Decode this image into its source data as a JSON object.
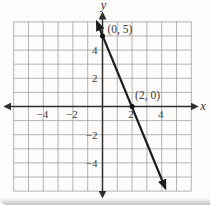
{
  "chart_data": {
    "type": "line",
    "title": "",
    "xlabel": "x",
    "ylabel": "y",
    "xlim": [
      -6,
      6
    ],
    "ylim": [
      -6,
      6
    ],
    "grid": true,
    "grid_step": 1,
    "x_tick_labels": [
      {
        "value": -4,
        "label": "−4"
      },
      {
        "value": -2,
        "label": "−2"
      },
      {
        "value": 2,
        "label": "2"
      },
      {
        "value": 4,
        "label": "4"
      }
    ],
    "y_tick_labels": [
      {
        "value": 4,
        "label": "4"
      },
      {
        "value": 2,
        "label": "2"
      },
      {
        "value": -2,
        "label": "−2"
      },
      {
        "value": -4,
        "label": "−4"
      }
    ],
    "series": [
      {
        "points": [
          {
            "x": 0,
            "y": 5,
            "label": "(0, 5)",
            "label_offset": {
              "dx": 5,
              "dy": -3
            }
          },
          {
            "x": 2,
            "y": 0,
            "label": "(2, 0)",
            "label_offset": {
              "dx": 3,
              "dy": -8
            }
          }
        ],
        "draw_from": {
          "x": -0.38,
          "y": 6.0
        },
        "draw_to": {
          "x": 4.25,
          "y": -5.8
        },
        "arrows": "both"
      }
    ],
    "colors": {
      "background": "#fdfcfa",
      "grid": "#9b9b9b",
      "axis": "#2f2f2f",
      "line": "#1e1e1e",
      "point": "#111111",
      "text": "#3a3a3a"
    }
  }
}
